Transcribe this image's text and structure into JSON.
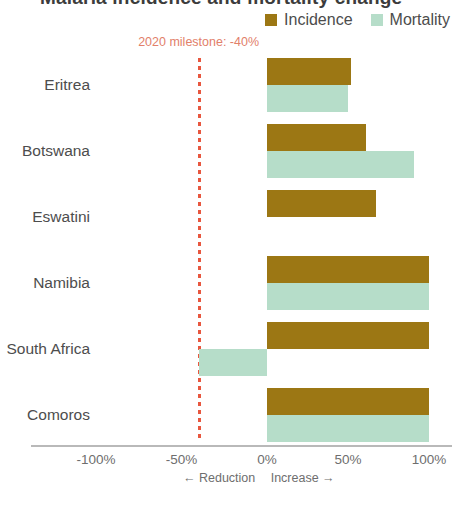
{
  "title": "Malaria incidence and mortality change",
  "legend": {
    "position": "top-right",
    "items": [
      {
        "label": "Incidence",
        "color": "#9c7714",
        "icon": "square-swatch"
      },
      {
        "label": "Mortality",
        "color": "#b6ddc9",
        "icon": "square-swatch"
      }
    ]
  },
  "annotation": {
    "text": "2020 milestone: -40%",
    "value": -40,
    "color": "#e8573f",
    "label_color": "#e2806a"
  },
  "axis": {
    "ticks": [
      "-100%",
      "-50%",
      "0%",
      "50%",
      "100%"
    ],
    "tick_values": [
      -100,
      -50,
      0,
      50,
      100
    ],
    "left_direction": "← Reduction",
    "right_direction": "Increase →"
  },
  "chart_data": {
    "type": "bar",
    "orientation": "horizontal",
    "title": "Malaria incidence and mortality change",
    "xlabel": "",
    "ylabel": "",
    "xlim": [
      -100,
      100
    ],
    "grid": false,
    "legend_position": "top-right",
    "categories": [
      "Eritrea",
      "Botswana",
      "Eswatini",
      "Namibia",
      "South Africa",
      "Comoros"
    ],
    "series": [
      {
        "name": "Incidence",
        "color": "#9c7714",
        "values": [
          52,
          61,
          67,
          100,
          100,
          100
        ]
      },
      {
        "name": "Mortality",
        "color": "#b6ddc9",
        "values": [
          50,
          91,
          null,
          100,
          -40,
          100
        ]
      }
    ],
    "annotations": [
      {
        "type": "vline",
        "x": -40,
        "text": "2020 milestone: -40%",
        "color": "#e8573f"
      }
    ]
  }
}
